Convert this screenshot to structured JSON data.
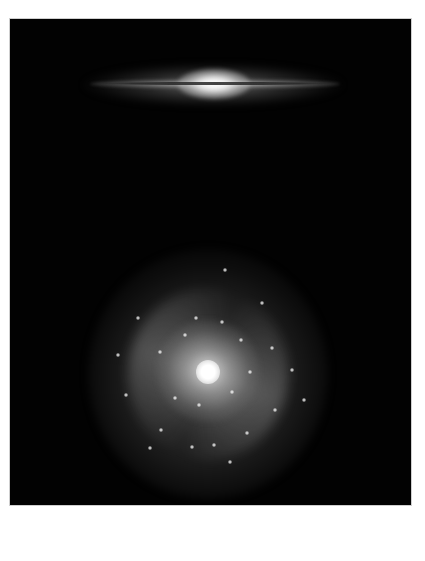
{
  "image": {
    "description": "Two galaxies on black background: an edge-on disk galaxy with dust lane (top) and a face-on spiral galaxy (bottom)",
    "background_color": "#020202",
    "page_color": "#ffffff"
  },
  "galaxies": [
    {
      "name": "edge-on-galaxy",
      "type": "edge-on spiral with dust lane",
      "center": [
        213,
        83
      ],
      "width_px": 250
    },
    {
      "name": "face-on-spiral-galaxy",
      "type": "face-on grand-design spiral",
      "center": [
        208,
        374
      ],
      "radius_px": 120
    }
  ],
  "star_forming_knots": [
    [
      196,
      318
    ],
    [
      222,
      322
    ],
    [
      185,
      335
    ],
    [
      241,
      340
    ],
    [
      160,
      352
    ],
    [
      250,
      372
    ],
    [
      232,
      392
    ],
    [
      199,
      405
    ],
    [
      175,
      398
    ],
    [
      161,
      430
    ],
    [
      192,
      447
    ],
    [
      247,
      433
    ],
    [
      272,
      348
    ],
    [
      292,
      370
    ],
    [
      304,
      400
    ],
    [
      138,
      318
    ],
    [
      118,
      355
    ],
    [
      126,
      395
    ],
    [
      150,
      448
    ],
    [
      230,
      462
    ],
    [
      214,
      445
    ],
    [
      262,
      303
    ],
    [
      275,
      410
    ],
    [
      225,
      270
    ]
  ]
}
